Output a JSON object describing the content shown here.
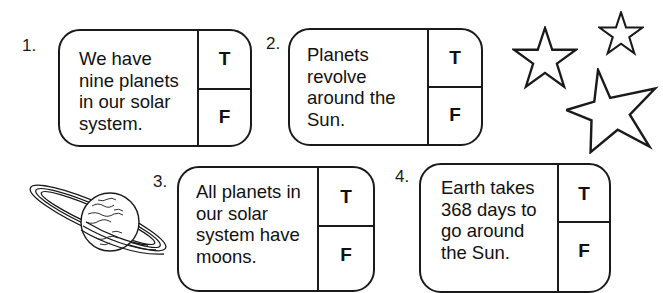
{
  "worksheet": {
    "questions": [
      {
        "number": "1.",
        "statement": "We have\nnine planets\nin our solar\nsystem.",
        "true_label": "T",
        "false_label": "F"
      },
      {
        "number": "2.",
        "statement": "Planets\nrevolve\naround the\nSun.",
        "true_label": "T",
        "false_label": "F"
      },
      {
        "number": "3.",
        "statement": "All planets in\nour solar\nsystem have\nmoons.",
        "true_label": "T",
        "false_label": "F"
      },
      {
        "number": "4.",
        "statement": "Earth takes\n368 days to\ngo around\nthe Sun.",
        "true_label": "T",
        "false_label": "F"
      }
    ],
    "illustrations": [
      "star-icon",
      "star-icon",
      "star-icon",
      "saturn-icon"
    ],
    "colors": {
      "ink": "#1a1a1a",
      "paper": "#ffffff"
    }
  }
}
